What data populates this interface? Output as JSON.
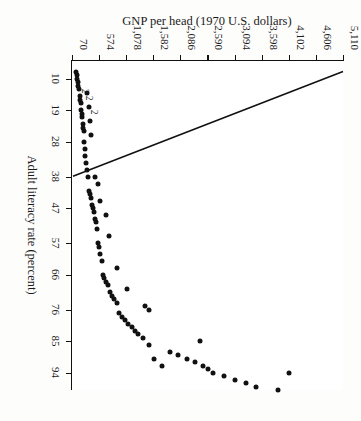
{
  "figure": {
    "orientation_degrees": 90,
    "background_color": "#fdfdfc",
    "ink_color": "#111111"
  },
  "chart_data": {
    "type": "scatter",
    "title": "",
    "xlabel": "Adult literacy rate (percent)",
    "ylabel": "GNP per head (1970 U.S. dollars)",
    "xlim": [
      5,
      99
    ],
    "ylim": [
      70,
      5110
    ],
    "grid": false,
    "legend": null,
    "xticks": [
      10,
      19,
      28,
      38,
      47,
      57,
      66,
      76,
      85,
      94
    ],
    "xticklabels": [
      "10",
      "19",
      "28",
      "38",
      "47",
      "57",
      "66",
      "76",
      "85",
      "94"
    ],
    "yticks": [
      70,
      574,
      1078,
      1582,
      2086,
      2590,
      3094,
      3598,
      4102,
      4606,
      5110
    ],
    "yticklabels": [
      "70",
      "574",
      "1,078",
      "1,582",
      "2,086",
      "2,590",
      "3,094",
      "3,598",
      "4,102",
      "4,606",
      "5,110"
    ],
    "x": [
      94,
      99,
      98,
      97,
      96,
      95,
      94,
      93,
      92,
      91,
      90,
      89,
      88,
      92,
      90,
      86,
      85,
      84,
      83,
      82,
      81,
      80,
      79,
      78,
      77,
      76,
      75,
      74,
      73,
      72,
      71,
      70,
      69,
      68,
      67,
      66,
      64,
      62,
      60,
      58,
      57,
      55,
      53,
      51,
      50,
      49,
      48,
      47,
      46,
      45,
      44,
      43,
      42,
      40,
      38,
      38,
      36,
      34,
      32,
      30,
      28,
      26,
      25,
      24,
      23,
      22,
      21,
      20,
      19,
      18,
      17,
      16,
      15,
      14,
      13,
      12,
      11,
      10,
      9,
      8
    ],
    "y": [
      4102,
      3900,
      3500,
      3300,
      3100,
      2900,
      2700,
      2600,
      2500,
      2350,
      2200,
      2050,
      1900,
      1750,
      1600,
      1500,
      2450,
      1400,
      1300,
      1250,
      1180,
      1120,
      1060,
      1000,
      950,
      1500,
      1430,
      900,
      860,
      820,
      780,
      1100,
      740,
      700,
      660,
      640,
      900,
      620,
      600,
      580,
      560,
      760,
      540,
      520,
      500,
      700,
      480,
      460,
      440,
      600,
      420,
      400,
      380,
      560,
      500,
      360,
      340,
      330,
      320,
      310,
      300,
      420,
      290,
      280,
      270,
      400,
      260,
      250,
      240,
      380,
      230,
      220,
      210,
      340,
      200,
      190,
      180,
      170,
      160,
      150
    ],
    "point_count": 80,
    "coincident_markers": [
      {
        "label": "2",
        "x": 13,
        "y": 330
      },
      {
        "label": "2",
        "x": 11,
        "y": 250
      },
      {
        "label": "2",
        "x": 17,
        "y": 430
      }
    ],
    "fit_line": {
      "style": "solid",
      "color": "#111111",
      "description": "descending straight line from upper-left to the 38 tick at the baseline",
      "x_start": 8,
      "y_start": 5110,
      "x_end": 38,
      "y_end": 70
    }
  }
}
